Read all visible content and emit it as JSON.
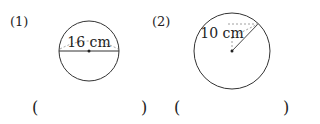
{
  "problems": [
    {
      "number": "(1)",
      "measure_label": "16 cm",
      "measure_type": "diameter",
      "answer_open": "(",
      "answer_close": ")",
      "answer_value": ""
    },
    {
      "number": "(2)",
      "measure_label": "10 cm",
      "measure_type": "radius",
      "answer_open": "(",
      "answer_close": ")",
      "answer_value": ""
    }
  ]
}
